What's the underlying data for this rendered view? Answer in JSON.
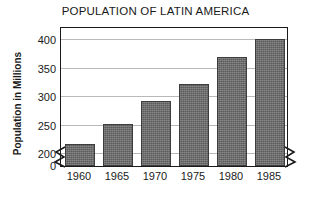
{
  "chart_data": {
    "type": "bar",
    "title": "POPULATION OF LATIN AMERICA",
    "xlabel": "",
    "ylabel": "Population in Millions",
    "categories": [
      "1960",
      "1965",
      "1970",
      "1975",
      "1980",
      "1985"
    ],
    "values": [
      218,
      253,
      294,
      323,
      370,
      402
    ],
    "ylim": [
      0,
      425
    ],
    "y_ticks": [
      "0",
      "200",
      "250",
      "300",
      "350",
      "400"
    ],
    "y_tick_values": [
      0,
      200,
      250,
      300,
      350,
      400
    ],
    "grid": "horizontal",
    "legend": "none",
    "axis_break": "y-axis broken between 0 and 200",
    "bar_color": "#6e6e6e",
    "gridline_color": "#b9b9b9",
    "axis_color": "#1a1a1a",
    "background_color": "#ffffff"
  },
  "axis_break_icons": {
    "left": "axis-break-zigzag-icon",
    "right": "axis-break-zigzag-icon"
  }
}
